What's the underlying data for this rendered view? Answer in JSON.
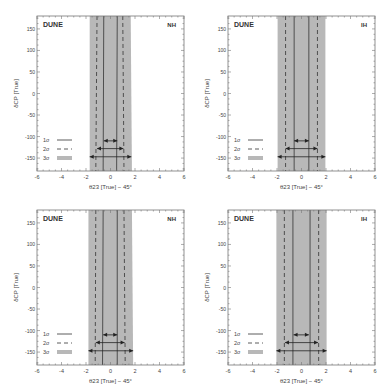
{
  "figure": {
    "panels": [
      {
        "id": "tl",
        "experiment": "DUNE",
        "hierarchy": "NH",
        "x": 0,
        "y": 0
      },
      {
        "id": "tr",
        "experiment": "DUNE",
        "hierarchy": "IH",
        "x": 191,
        "y": 0
      },
      {
        "id": "bl",
        "experiment": "DUNE",
        "hierarchy": "NH",
        "x": 0,
        "y": 194
      },
      {
        "id": "br",
        "experiment": "DUNE",
        "hierarchy": "IH",
        "x": 191,
        "y": 194
      }
    ],
    "colors": {
      "band3": "#b8b8b8",
      "line": "#333333",
      "frame": "#777777",
      "text": "#444444",
      "bandText": "#f2f2f2"
    }
  },
  "chart_data": [
    {
      "type": "area",
      "title": "DUNE NH",
      "label_experiment": "DUNE",
      "label_hierarchy": "NH",
      "xlabel": "θ23 [True] − 45°",
      "ylabel": "δCP [True]",
      "xlim": [
        -6,
        6
      ],
      "ylim": [
        -180,
        180
      ],
      "xticks": [
        "-6",
        "-4",
        "-2",
        "0",
        "2",
        "4",
        "6"
      ],
      "yticks": [
        "150",
        "100",
        "50",
        "0",
        "-50",
        "-100",
        "-150"
      ],
      "band_text": "Indistinguishable Regions",
      "legend": [
        {
          "label": "1σ",
          "style": "solid"
        },
        {
          "label": "2σ",
          "style": "dashed"
        },
        {
          "label": "3σ",
          "style": "band"
        }
      ],
      "series": [
        {
          "name": "1σ",
          "left": [
            -0.55,
            -0.6
          ],
          "right": [
            0.55,
            0.5
          ]
        },
        {
          "name": "2σ",
          "left": [
            -1.1,
            -1.2
          ],
          "right": [
            1.0,
            1.1
          ]
        },
        {
          "name": "3σ",
          "left": [
            -1.7,
            -1.7
          ],
          "right": [
            1.65,
            1.75
          ]
        }
      ],
      "arrows": {
        "1σ": [
          -0.55,
          0.55
        ],
        "2σ": [
          -1.1,
          1.05
        ],
        "3σ": [
          -1.7,
          1.7
        ]
      }
    },
    {
      "type": "area",
      "title": "DUNE IH",
      "label_experiment": "DUNE",
      "label_hierarchy": "IH",
      "xlabel": "θ23 [True] − 45°",
      "ylabel": "δCP [True]",
      "xlim": [
        -6,
        6
      ],
      "ylim": [
        -180,
        180
      ],
      "xticks": [
        "-6",
        "-4",
        "-2",
        "0",
        "2",
        "4",
        "6"
      ],
      "yticks": [
        "150",
        "100",
        "50",
        "0",
        "-50",
        "-100",
        "-150"
      ],
      "band_text": "Indistinguishable Regions",
      "legend": [
        {
          "label": "1σ",
          "style": "solid"
        },
        {
          "label": "2σ",
          "style": "dashed"
        },
        {
          "label": "3σ",
          "style": "band"
        }
      ],
      "series": [
        {
          "name": "1σ",
          "left": [
            -0.6,
            -0.6
          ],
          "right": [
            0.6,
            0.6
          ]
        },
        {
          "name": "2σ",
          "left": [
            -1.3,
            -1.3
          ],
          "right": [
            1.3,
            1.3
          ]
        },
        {
          "name": "3σ",
          "left": [
            -1.95,
            -1.95
          ],
          "right": [
            1.95,
            1.95
          ]
        }
      ],
      "arrows": {
        "1σ": [
          -0.6,
          0.6
        ],
        "2σ": [
          -1.3,
          1.3
        ],
        "3σ": [
          -1.95,
          1.95
        ]
      }
    },
    {
      "type": "area",
      "title": "DUNE NH",
      "label_experiment": "DUNE",
      "label_hierarchy": "NH",
      "xlabel": "θ23 [True] − 45°",
      "ylabel": "δCP [True]",
      "xlim": [
        -6,
        6
      ],
      "ylim": [
        -180,
        180
      ],
      "xticks": [
        "-6",
        "-4",
        "-2",
        "0",
        "2",
        "4",
        "6"
      ],
      "yticks": [
        "150",
        "100",
        "50",
        "0",
        "-50",
        "-100",
        "-150"
      ],
      "band_text": "Indistinguishable Regions",
      "legend": [
        {
          "label": "1σ",
          "style": "solid"
        },
        {
          "label": "2σ",
          "style": "dashed"
        },
        {
          "label": "3σ",
          "style": "band"
        }
      ],
      "series": [
        {
          "name": "1σ",
          "left": [
            -0.6,
            -0.65
          ],
          "right": [
            0.55,
            0.55
          ]
        },
        {
          "name": "2σ",
          "left": [
            -1.2,
            -1.25
          ],
          "right": [
            1.1,
            1.2
          ]
        },
        {
          "name": "3σ",
          "left": [
            -1.8,
            -1.8
          ],
          "right": [
            1.75,
            1.85
          ]
        }
      ],
      "arrows": {
        "1σ": [
          -0.6,
          0.55
        ],
        "2σ": [
          -1.2,
          1.15
        ],
        "3σ": [
          -1.8,
          1.85
        ]
      }
    },
    {
      "type": "area",
      "title": "DUNE IH",
      "label_experiment": "DUNE",
      "label_hierarchy": "IH",
      "xlabel": "θ23 [True] − 45°",
      "ylabel": "δCP [True]",
      "xlim": [
        -6,
        6
      ],
      "ylim": [
        -180,
        180
      ],
      "xticks": [
        "-6",
        "-4",
        "-2",
        "0",
        "2",
        "4",
        "6"
      ],
      "yticks": [
        "150",
        "100",
        "50",
        "0",
        "-50",
        "-100",
        "-150"
      ],
      "band_text": "Indistinguishable Regions",
      "legend": [
        {
          "label": "1σ",
          "style": "solid"
        },
        {
          "label": "2σ",
          "style": "dashed"
        },
        {
          "label": "3σ",
          "style": "band"
        }
      ],
      "series": [
        {
          "name": "1σ",
          "left": [
            -0.7,
            -0.7
          ],
          "right": [
            0.7,
            0.7
          ]
        },
        {
          "name": "2σ",
          "left": [
            -1.4,
            -1.4
          ],
          "right": [
            1.4,
            1.4
          ]
        },
        {
          "name": "3σ",
          "left": [
            -2.05,
            -2.05
          ],
          "right": [
            2.05,
            2.05
          ]
        }
      ],
      "arrows": {
        "1σ": [
          -0.65,
          0.6
        ],
        "2σ": [
          -1.35,
          1.35
        ],
        "3σ": [
          -2.05,
          2.05
        ]
      }
    }
  ]
}
